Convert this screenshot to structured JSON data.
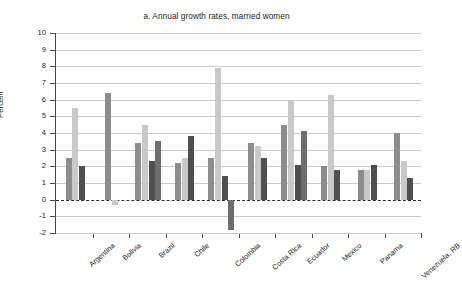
{
  "page": {
    "cut_off_header": "",
    "background": "#ffffff"
  },
  "chart": {
    "title": "a. Annual growth rates, married women",
    "ylabel": "Percent"
  },
  "colors": {
    "series_medium": "#8d8d8d",
    "series_light": "#c9c9c9",
    "series_dark": "#4f4f4f",
    "series_mid_dark": "#6e6e6e",
    "grid": "#c9c9c9",
    "axis": "#4a4a4a",
    "text": "#1a1a1a"
  },
  "chart_data": {
    "type": "bar",
    "title": "a. Annual growth rates, married women",
    "xlabel": "",
    "ylabel": "Percent",
    "ylim": [
      -2,
      10
    ],
    "yticks": [
      10,
      9,
      8,
      7,
      6,
      5,
      4,
      3,
      2,
      1,
      0,
      -1,
      -2
    ],
    "ytick_labels": [
      "10",
      "9",
      "8",
      "7",
      "6",
      "5",
      "4",
      "3",
      "2",
      "1",
      "0",
      "-1",
      "-2"
    ],
    "grid": true,
    "legend": null,
    "zero_reference_line": 0,
    "categories": [
      "Argentina",
      "Bolivia",
      "Brazil",
      "Chile",
      "Colombia",
      "Costa Rica",
      "Ecuador",
      "Mexico",
      "Panama",
      "Venezuela, RB"
    ],
    "groups": [
      {
        "category": "Argentina",
        "bars": [
          2.5,
          5.5,
          2.0
        ]
      },
      {
        "category": "Bolivia",
        "bars": [
          6.4,
          -0.3
        ]
      },
      {
        "category": "Brazil",
        "bars": [
          3.4,
          4.5,
          2.3,
          3.5
        ]
      },
      {
        "category": "Chile",
        "bars": [
          2.2,
          2.5,
          3.8
        ]
      },
      {
        "category": "Colombia",
        "bars": [
          2.5,
          7.9,
          1.4,
          -1.8
        ]
      },
      {
        "category": "Costa Rica",
        "bars": [
          3.4,
          3.2,
          2.5
        ]
      },
      {
        "category": "Ecuador",
        "bars": [
          4.5,
          6.0,
          2.1,
          4.1
        ]
      },
      {
        "category": "Mexico",
        "bars": [
          2.0,
          6.3,
          1.8
        ]
      },
      {
        "category": "Panama",
        "bars": [
          1.8,
          1.8,
          2.1
        ]
      },
      {
        "category": "Venezuela, RB",
        "bars": [
          4.0,
          2.3,
          1.3
        ]
      }
    ]
  }
}
